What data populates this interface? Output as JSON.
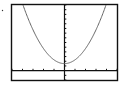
{
  "chart_data": {
    "type": "line",
    "title": "",
    "xlabel": "",
    "ylabel": "",
    "xlim": [
      -10,
      10
    ],
    "ylim": [
      -2,
      14
    ],
    "x_tick_step": 2,
    "y_tick_step": 1,
    "grid": false,
    "legend": "none",
    "series": [
      {
        "name": "parabola",
        "equation": "y = 0.2*x^2 + 1.5",
        "x": [
          -7,
          -6,
          -5,
          -4,
          -3,
          -2,
          -1,
          0,
          1,
          2,
          3,
          4,
          5,
          6,
          7
        ],
        "y": [
          11.3,
          8.7,
          6.5,
          4.7,
          3.3,
          2.3,
          1.7,
          1.5,
          1.7,
          2.3,
          3.3,
          4.7,
          6.5,
          8.7,
          11.3
        ],
        "color": "#666666"
      }
    ]
  },
  "colors": {
    "frame": "#111111",
    "axis": "#111111",
    "curve": "#666666",
    "background": "#ffffff"
  }
}
